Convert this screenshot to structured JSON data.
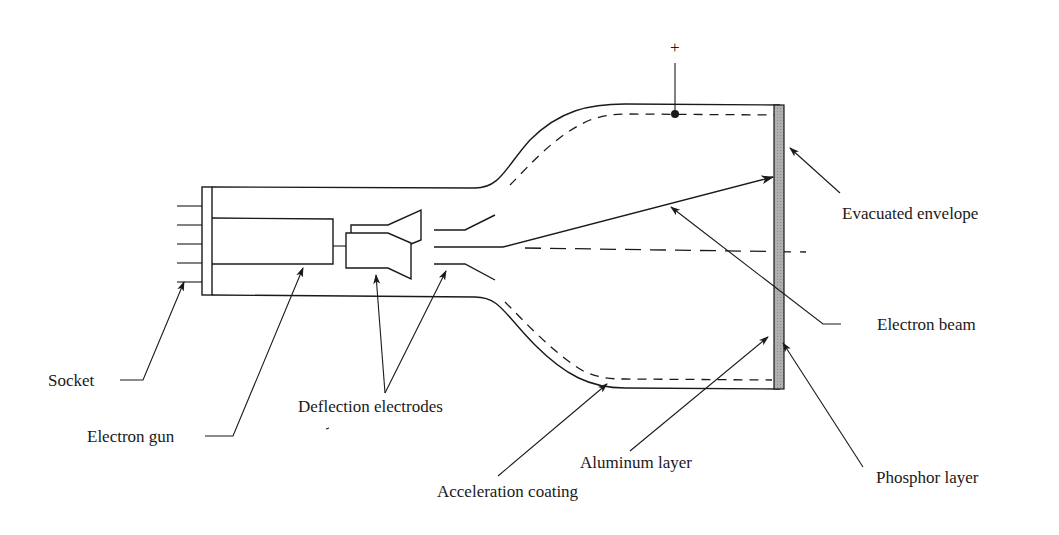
{
  "diagram": {
    "colors": {
      "line": "#1a1a1a",
      "screen_fill": "#a9a9a9",
      "background": "#ffffff"
    },
    "terminal_symbol": "+",
    "labels": {
      "socket": "Socket",
      "electron_gun": "Electron gun",
      "deflection_electrodes": "Deflection electrodes",
      "acceleration_coating": "Acceleration coating",
      "aluminum_layer": "Aluminum layer",
      "phosphor_layer": "Phosphor layer",
      "electron_beam": "Electron beam",
      "evacuated_envelope": "Evacuated envelope"
    }
  }
}
